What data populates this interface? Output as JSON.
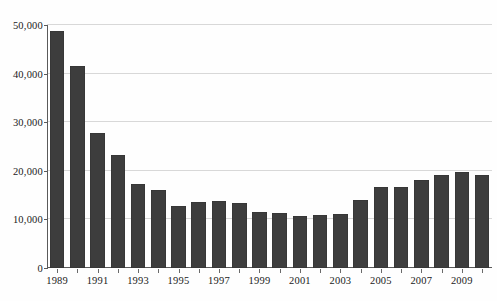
{
  "chart_data": {
    "type": "bar",
    "title": "",
    "subtitle": "",
    "xlabel": "",
    "ylabel": "",
    "categories": [
      "1989",
      "1990",
      "1991",
      "1992",
      "1993",
      "1994",
      "1995",
      "1996",
      "1997",
      "1998",
      "1999",
      "2000",
      "2001",
      "2002",
      "2003",
      "2004",
      "2005",
      "2006",
      "2007",
      "2008",
      "2009",
      "2010"
    ],
    "values": [
      48700,
      41600,
      27800,
      23300,
      17300,
      16000,
      12800,
      13600,
      13800,
      13400,
      11500,
      11400,
      10700,
      10900,
      11100,
      14000,
      16600,
      16700,
      18100,
      19100,
      19800,
      19100
    ],
    "ylim": [
      0,
      50000
    ],
    "yticks": [
      0,
      10000,
      20000,
      30000,
      40000,
      50000
    ],
    "ytick_labels": [
      "0",
      "10,000",
      "20,000",
      "30,000",
      "40,000",
      "50,000"
    ],
    "xtick_labels": [
      "1989",
      "",
      "1991",
      "",
      "1993",
      "",
      "1995",
      "",
      "1997",
      "",
      "1999",
      "",
      "2001",
      "",
      "2003",
      "",
      "2005",
      "",
      "2007",
      "",
      "2009",
      ""
    ],
    "grid": true,
    "grid_axis": "y",
    "legend": null,
    "legend_position": "none",
    "series": [
      {
        "name": "",
        "values": [
          48700,
          41600,
          27800,
          23300,
          17300,
          16000,
          12800,
          13600,
          13800,
          13400,
          11500,
          11400,
          10700,
          10900,
          11100,
          14000,
          16600,
          16700,
          18100,
          19100,
          19800,
          19100
        ]
      }
    ],
    "colors": {
      "bar": "#3d3d3d",
      "gridline": "#d8d8d8",
      "axis": "#5a5a5a",
      "background": "#ffffff",
      "text": "#1a1a1a"
    }
  }
}
